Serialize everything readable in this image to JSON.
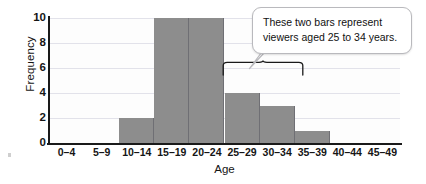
{
  "chart_data": {
    "type": "bar",
    "title": "",
    "xlabel": "Age",
    "ylabel": "Frequency",
    "categories": [
      "0–4",
      "5–9",
      "10–14",
      "15–19",
      "20–24",
      "25–29",
      "30–34",
      "35–39",
      "40–44",
      "45–49"
    ],
    "values": [
      0,
      0,
      2,
      10,
      10,
      4,
      3,
      1,
      0,
      0
    ],
    "ylim": [
      0,
      10
    ],
    "yticks": [
      0,
      2,
      4,
      6,
      8,
      10
    ],
    "ytick_labels": [
      "0",
      "2",
      "4",
      "6",
      "8",
      "10"
    ],
    "grid": true,
    "legend": "none",
    "bar_color": "#8d8d8d",
    "bar_edge_color": "#6f6f74",
    "gridline_color": "#e2e2ea",
    "axis_color": "#1a1a1a",
    "plot_background": "#fdfdfd",
    "annotations": [
      {
        "name": "callout",
        "lines": [
          "These two bars represent",
          "viewers aged 25 to 34 years."
        ],
        "points_to": [
          "25–29",
          "30–34"
        ]
      },
      {
        "name": "brace",
        "spans": [
          "25–29",
          "30–34"
        ]
      }
    ]
  },
  "axes": {
    "y_title": "Frequency",
    "x_title": "Age"
  },
  "callout": {
    "line1": "These two bars represent",
    "line2": "viewers aged 25 to 34 years."
  }
}
